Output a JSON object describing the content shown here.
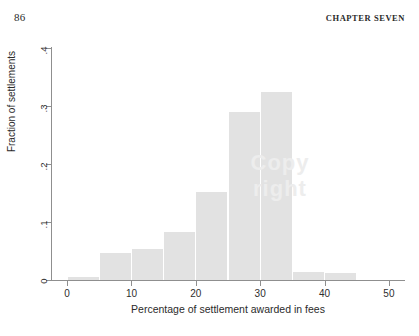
{
  "page": {
    "folio": "86",
    "running_head": "CHAPTER SEVEN"
  },
  "watermark": {
    "line1": "Copy",
    "line2": "right"
  },
  "chart_data": {
    "type": "bar",
    "title": "",
    "subtitle": "",
    "xlabel": "Percentage of settlement awarded in fees",
    "ylabel": "Fraction of settlements",
    "xlim": [
      -2.5,
      52.5
    ],
    "ylim": [
      0,
      0.4
    ],
    "grid": false,
    "legend": null,
    "bar_color": "#e2e2e2",
    "axis_color": "#8f8f8f",
    "bin_width": 5,
    "xticks": [
      0,
      10,
      20,
      30,
      40,
      50
    ],
    "xtick_labels": [
      "0",
      "10",
      "20",
      "30",
      "40",
      "50"
    ],
    "yticks": [
      0,
      0.1,
      0.2,
      0.3,
      0.4
    ],
    "ytick_labels": [
      "0",
      ".1",
      ".2",
      ".3",
      ".4"
    ],
    "bins": [
      {
        "x0": 0,
        "x1": 5,
        "value": 0.005
      },
      {
        "x0": 5,
        "x1": 10,
        "value": 0.046
      },
      {
        "x0": 10,
        "x1": 15,
        "value": 0.054
      },
      {
        "x0": 15,
        "x1": 20,
        "value": 0.082
      },
      {
        "x0": 20,
        "x1": 25,
        "value": 0.152
      },
      {
        "x0": 25,
        "x1": 30,
        "value": 0.29
      },
      {
        "x0": 30,
        "x1": 35,
        "value": 0.325
      },
      {
        "x0": 35,
        "x1": 40,
        "value": 0.014
      },
      {
        "x0": 40,
        "x1": 45,
        "value": 0.012
      }
    ],
    "categories": [
      "0-5",
      "5-10",
      "10-15",
      "15-20",
      "20-25",
      "25-30",
      "30-35",
      "35-40",
      "40-45"
    ],
    "values": [
      0.005,
      0.046,
      0.054,
      0.082,
      0.152,
      0.29,
      0.325,
      0.014,
      0.012
    ]
  }
}
